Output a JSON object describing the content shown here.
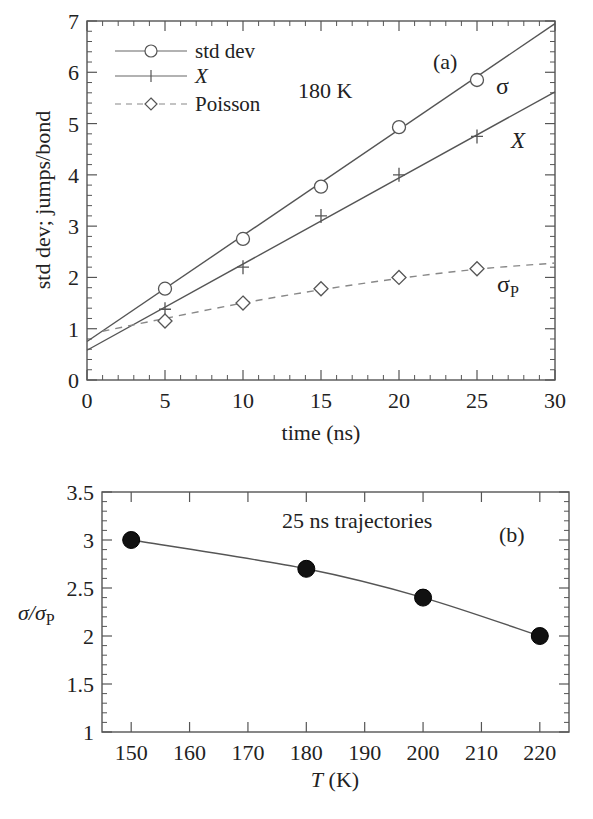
{
  "chart_data": [
    {
      "panel": "(a)",
      "type": "line",
      "title": "",
      "annotation": "180 K",
      "panel_label": "(a)",
      "xlabel": "time (ns)",
      "ylabel": "std dev; jumps/bond",
      "xlim": [
        0,
        30
      ],
      "ylim": [
        0,
        7
      ],
      "xticks": [
        0,
        5,
        10,
        15,
        20,
        25,
        30
      ],
      "yticks": [
        0,
        1,
        2,
        3,
        4,
        5,
        6,
        7
      ],
      "grid": false,
      "legend_position": "upper-left",
      "x": [
        5,
        10,
        15,
        20,
        25
      ],
      "series": [
        {
          "name": "std dev",
          "marker": "circle-open",
          "linestyle": "solid",
          "label_on_plot": "σ",
          "values": [
            1.78,
            2.75,
            3.77,
            4.93,
            5.85
          ],
          "fit": {
            "x": [
              0,
              30
            ],
            "y": [
              0.75,
              6.95
            ]
          }
        },
        {
          "name": "X",
          "marker": "plus",
          "linestyle": "solid",
          "label_on_plot": "X",
          "values": [
            1.38,
            2.2,
            3.2,
            4.0,
            4.75
          ],
          "fit": {
            "x": [
              0,
              30
            ],
            "y": [
              0.58,
              5.62
            ]
          }
        },
        {
          "name": "Poisson",
          "marker": "diamond-open",
          "linestyle": "dashed",
          "label_on_plot": "σP",
          "values": [
            1.15,
            1.5,
            1.78,
            2.0,
            2.17
          ],
          "fit": {
            "x": [
              1,
              5,
              10,
              15,
              20,
              25,
              30
            ],
            "y": [
              0.95,
              1.2,
              1.5,
              1.76,
              1.98,
              2.16,
              2.28
            ]
          }
        }
      ]
    },
    {
      "panel": "(b)",
      "type": "line",
      "title": "",
      "annotation": "25 ns trajectories",
      "panel_label": "(b)",
      "xlabel": "T (K)",
      "ylabel": "σ/σP",
      "xlim": [
        145,
        225
      ],
      "ylim": [
        1,
        3.5
      ],
      "xticks": [
        150,
        160,
        170,
        180,
        190,
        200,
        210,
        220
      ],
      "yticks": [
        1,
        1.5,
        2,
        2.5,
        3,
        3.5
      ],
      "grid": false,
      "x": [
        150,
        180,
        200,
        220
      ],
      "series": [
        {
          "name": "σ/σP",
          "marker": "circle-filled",
          "linestyle": "solid",
          "values": [
            3.0,
            2.7,
            2.4,
            2.0
          ]
        }
      ]
    }
  ],
  "panel_a": {
    "xlabel": "time (ns)",
    "ylabel": "std dev; jumps/bond",
    "annotation": "180 K",
    "panel_label": "(a)",
    "legend": [
      "std dev",
      "X",
      "Poisson"
    ],
    "curve_labels": {
      "sigma": "σ",
      "x": "X",
      "sigma_p": "σ",
      "sigma_p_sub": "P"
    },
    "xtick_labels": [
      "0",
      "5",
      "10",
      "15",
      "20",
      "25",
      "30"
    ],
    "ytick_labels": [
      "0",
      "1",
      "2",
      "3",
      "4",
      "5",
      "6",
      "7"
    ]
  },
  "panel_b": {
    "xlabel_italic": "T",
    "xlabel_rest": " (K)",
    "ylabel_main": "σ/σ",
    "ylabel_sub": "P",
    "annotation": "25 ns trajectories",
    "panel_label": "(b)",
    "xtick_labels": [
      "150",
      "160",
      "170",
      "180",
      "190",
      "200",
      "210",
      "220"
    ],
    "ytick_labels": [
      "1",
      "1.5",
      "2",
      "2.5",
      "3",
      "3.5"
    ]
  },
  "colors": {
    "line": "#555555",
    "marker_fill": "#111111",
    "axis": "#555555",
    "text": "#222222"
  }
}
